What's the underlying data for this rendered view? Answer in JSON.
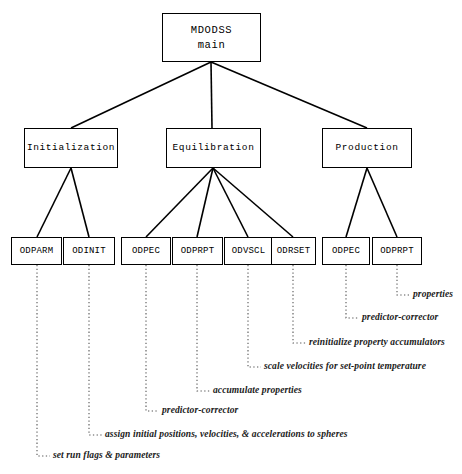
{
  "diagram": {
    "line_color": "#000000",
    "leader_color": "#555555",
    "background": "#ffffff",
    "nodes": {
      "root": {
        "line1": "MDODSS",
        "line2": "main"
      },
      "level2": [
        {
          "label": "Initialization"
        },
        {
          "label": "Equilibration"
        },
        {
          "label": "Production"
        }
      ],
      "leaves": [
        {
          "label": "ODPARM"
        },
        {
          "label": "ODINIT"
        },
        {
          "label": "ODPEC"
        },
        {
          "label": "ODPRPT"
        },
        {
          "label": "ODVSCL"
        },
        {
          "label": "ODRSET"
        },
        {
          "label": "ODPEC"
        },
        {
          "label": "ODPRPT"
        }
      ]
    },
    "annotations": [
      {
        "text": "set run flags & parameters"
      },
      {
        "text": "assign initial positions, velocities, & accelerations to spheres"
      },
      {
        "text": "predictor-corrector"
      },
      {
        "text": "accumulate properties"
      },
      {
        "text": "scale velocities for set-point temperature"
      },
      {
        "text": "reinitialize property accumulators"
      },
      {
        "text": "predictor-corrector"
      },
      {
        "text": "properties"
      }
    ]
  }
}
